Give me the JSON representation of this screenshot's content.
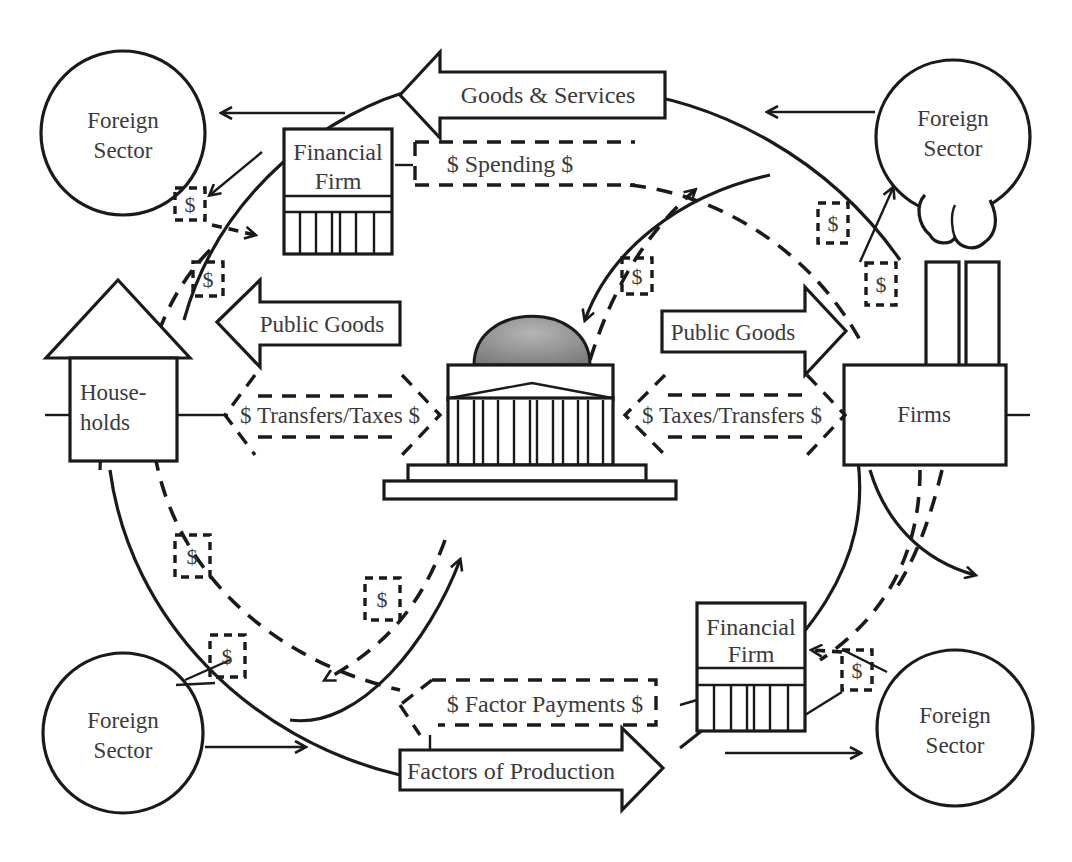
{
  "diagram": {
    "nodes": {
      "foreign_top_left": {
        "line1": "Foreign",
        "line2": "Sector"
      },
      "foreign_top_right": {
        "line1": "Foreign",
        "line2": "Sector"
      },
      "foreign_bottom_left": {
        "line1": "Foreign",
        "line2": "Sector"
      },
      "foreign_bottom_right": {
        "line1": "Foreign",
        "line2": "Sector"
      },
      "financial_top": {
        "line1": "Financial",
        "line2": "Firm"
      },
      "financial_bottom": {
        "line1": "Financial",
        "line2": "Firm"
      },
      "households": {
        "line1": "House-",
        "line2": "holds"
      },
      "firms": {
        "label": "Firms"
      },
      "government": {
        "label": "Government (capitol building)"
      }
    },
    "flows": {
      "goods_services": "Goods & Services",
      "spending": "$ Spending $",
      "public_goods_left": "Public Goods",
      "public_goods_right": "Public Goods",
      "transfers_taxes": "$ Transfers/Taxes $",
      "taxes_transfers": "$ Taxes/Transfers $",
      "factor_payments": "$ Factor Payments $",
      "factors_production": "Factors of Production"
    },
    "money_tags": [
      "$",
      "$",
      "$",
      "$",
      "$",
      "$",
      "$",
      "$",
      "$"
    ],
    "colors": {
      "stroke": "#1a1a1a",
      "text": "#3a3a3a",
      "dome": "#8f8f8f",
      "background": "#ffffff"
    }
  }
}
